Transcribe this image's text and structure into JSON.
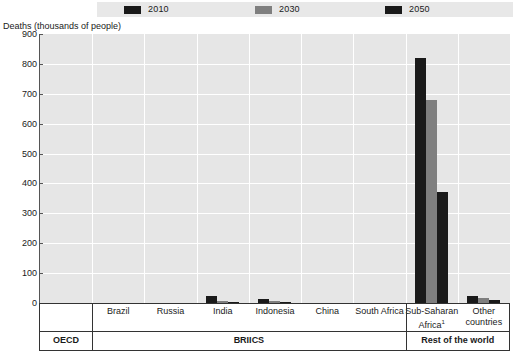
{
  "axis_title": "Deaths (thousands of people)",
  "legend": {
    "items": [
      {
        "label": "2010",
        "color": "#1a1a1a"
      },
      {
        "label": "2030",
        "color": "#7f7f7f"
      },
      {
        "label": "2050",
        "color": "#1a1a1a"
      }
    ]
  },
  "y_ticks": [
    "900",
    "800",
    "700",
    "600",
    "500",
    "400",
    "300",
    "200",
    "100",
    "0"
  ],
  "groups": [
    {
      "label": "OECD"
    },
    {
      "label": "BRIICS"
    },
    {
      "label": "Rest of the world"
    }
  ],
  "chart_data": {
    "type": "bar",
    "title": "",
    "subtitle": "",
    "xlabel": "",
    "ylabel": "Deaths (thousands of people)",
    "ylim": [
      0,
      900
    ],
    "ytick_step": 100,
    "grid": true,
    "legend_position": "top",
    "categories": [
      "",
      "Brazil",
      "Russia",
      "India",
      "Indonesia",
      "China",
      "South Africa",
      "Sub-Saharan Africa",
      "Other countries"
    ],
    "category_groups": [
      "OECD",
      "BRIICS",
      "BRIICS",
      "BRIICS",
      "BRIICS",
      "BRIICS",
      "BRIICS",
      "Rest of the world",
      "Rest of the world"
    ],
    "series": [
      {
        "name": "2010",
        "color": "#1a1a1a",
        "values": [
          0,
          0,
          0,
          25,
          12,
          1,
          1,
          820,
          25
        ]
      },
      {
        "name": "2030",
        "color": "#7f7f7f",
        "values": [
          0,
          0,
          0,
          6,
          6,
          0,
          0,
          680,
          18
        ]
      },
      {
        "name": "2050",
        "color": "#1a1a1a",
        "values": [
          0,
          0,
          0,
          3,
          3,
          0,
          0,
          370,
          9
        ]
      }
    ],
    "footnotes": [
      "1"
    ]
  }
}
